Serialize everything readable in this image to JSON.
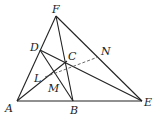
{
  "diagram": {
    "type": "geometry",
    "points": {
      "A": {
        "x": 17,
        "y": 101
      },
      "B": {
        "x": 73,
        "y": 101
      },
      "E": {
        "x": 142,
        "y": 101
      },
      "F": {
        "x": 56,
        "y": 16
      },
      "D": {
        "x": 40,
        "y": 50
      },
      "C": {
        "x": 67,
        "y": 61
      },
      "N": {
        "x": 98,
        "y": 57
      },
      "L": {
        "x": 45,
        "y": 77
      },
      "M": {
        "x": 54,
        "y": 78
      }
    },
    "labels": [
      {
        "text": "F",
        "x": 52,
        "y": 13
      },
      {
        "text": "D",
        "x": 30,
        "y": 51
      },
      {
        "text": "C",
        "x": 68,
        "y": 60
      },
      {
        "text": "N",
        "x": 101,
        "y": 55
      },
      {
        "text": "L",
        "x": 34,
        "y": 82
      },
      {
        "text": "M",
        "x": 48,
        "y": 92
      },
      {
        "text": "A",
        "x": 5,
        "y": 112
      },
      {
        "text": "B",
        "x": 70,
        "y": 114
      },
      {
        "text": "E",
        "x": 144,
        "y": 106
      }
    ],
    "segments": [
      [
        "A",
        "F"
      ],
      [
        "F",
        "E"
      ],
      [
        "A",
        "E"
      ],
      [
        "F",
        "B"
      ],
      [
        "D",
        "B"
      ],
      [
        "D",
        "E"
      ],
      [
        "A",
        "C"
      ]
    ],
    "dashed_segments": [
      [
        "L",
        "N"
      ]
    ]
  }
}
